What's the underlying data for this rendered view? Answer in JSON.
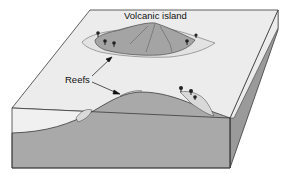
{
  "diagram": {
    "type": "block-diagram",
    "labels": {
      "volcanic_island": "Volcanic island",
      "reefs": "Reefs"
    },
    "colors": {
      "sea_surface": "#ececec",
      "water_front": "#f0f0f0",
      "rock": "#a9a9a9",
      "rock_side": "#9a9a9a",
      "island": "#a4a4a4",
      "reef_shallow": "#d9d9d9",
      "outline": "#3a3a3a"
    }
  }
}
